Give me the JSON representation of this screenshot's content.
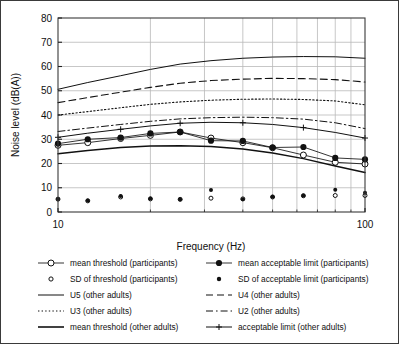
{
  "chart_data": {
    "type": "line",
    "title": "",
    "xlabel": "Frequency  (Hz)",
    "ylabel": "Noise level  (dB(A))",
    "xscale": "log",
    "xlim": [
      10,
      100
    ],
    "ylim": [
      0,
      80
    ],
    "ytick_labels": [
      "0",
      "10",
      "20",
      "30",
      "40",
      "50",
      "60",
      "70",
      "80"
    ],
    "yticks": [
      0,
      10,
      20,
      30,
      40,
      50,
      60,
      70,
      80
    ],
    "xtick_labels": [
      "10",
      "100"
    ],
    "xticks": [
      10,
      100
    ],
    "x_minor_gridlines": [
      20,
      30,
      40,
      50,
      60,
      70,
      80,
      90
    ],
    "grid": "both",
    "legend_position": "below-plot",
    "x": [
      10,
      12.5,
      16,
      20,
      25,
      31.5,
      40,
      50,
      63,
      80,
      100
    ],
    "series": [
      {
        "name": "mean threshold   (participants)",
        "key": "mean_threshold_participants",
        "style": "line-marker-open-circle",
        "values": [
          27.5,
          28.6,
          30.3,
          31.6,
          33.0,
          30.5,
          28.6,
          26.5,
          23.5,
          20.5,
          19.8
        ]
      },
      {
        "name": "mean acceptable limit (participants)",
        "key": "mean_limit_participants",
        "style": "line-marker-filled-circle",
        "values": [
          28.2,
          30.0,
          30.7,
          32.4,
          33.0,
          29.4,
          29.3,
          26.6,
          26.8,
          22.3,
          21.7
        ]
      },
      {
        "name": "SD of threshold   (participants)",
        "key": "sd_threshold_participants",
        "style": "marker-open-circle",
        "values": [
          5.3,
          4.6,
          6.2,
          5.4,
          5.2,
          5.7,
          5.4,
          6.2,
          6.7,
          6.8,
          6.8
        ]
      },
      {
        "name": "SD of acceptable limit (participants)",
        "key": "sd_limit_participants",
        "style": "marker-filled-circle",
        "values": [
          5.4,
          4.7,
          6.6,
          5.6,
          5.3,
          9.1,
          5.3,
          6.3,
          6.8,
          9.2,
          7.9
        ]
      },
      {
        "name": "U5 (other adults)",
        "key": "u5_other_adults",
        "style": "solid",
        "values": [
          50.6,
          53.4,
          56.2,
          58.8,
          61.0,
          62.4,
          63.4,
          63.9,
          64.1,
          64.0,
          63.4
        ]
      },
      {
        "name": "U4 (other adults)",
        "key": "u4_other_adults",
        "style": "dashed",
        "values": [
          45.1,
          47.2,
          49.4,
          51.4,
          53.1,
          54.2,
          54.8,
          55.1,
          55.0,
          54.6,
          53.6
        ]
      },
      {
        "name": "U3 (other adults)",
        "key": "u3_other_adults",
        "style": "dotted",
        "values": [
          40.0,
          41.4,
          43.0,
          44.4,
          45.4,
          46.1,
          46.5,
          46.6,
          46.4,
          45.8,
          44.2
        ]
      },
      {
        "name": "U2 (other adults)",
        "key": "u2_other_adults",
        "style": "dashdot",
        "values": [
          33.2,
          34.6,
          36.1,
          37.4,
          38.4,
          38.9,
          39.1,
          38.9,
          38.3,
          36.8,
          34.4
        ]
      },
      {
        "name": "mean threshold (other adults)",
        "key": "mean_threshold_other_adults",
        "style": "solid-thick",
        "values": [
          24.0,
          25.4,
          26.6,
          27.2,
          27.3,
          27.0,
          26.0,
          24.3,
          22.0,
          19.0,
          16.3
        ]
      },
      {
        "name": "acceptable limit  (other adults)",
        "key": "acceptable_limit_other_adults",
        "style": "solid-plus",
        "values": [
          30.8,
          32.5,
          34.1,
          35.5,
          36.6,
          37.0,
          36.8,
          36.1,
          34.8,
          32.8,
          30.5
        ]
      }
    ]
  },
  "legend": {
    "rows": [
      {
        "left": {
          "label": "mean threshold   (participants)",
          "style": "line-marker-open-circle"
        },
        "right": {
          "label": "mean acceptable limit (participants)",
          "style": "line-marker-filled-circle"
        }
      },
      {
        "left": {
          "label": "SD of threshold   (participants)",
          "style": "marker-open-circle"
        },
        "right": {
          "label": "SD of acceptable limit (participants)",
          "style": "marker-filled-circle"
        }
      },
      {
        "left": {
          "label": "U5 (other adults)",
          "style": "solid"
        },
        "right": {
          "label": "U4 (other adults)",
          "style": "dashed"
        }
      },
      {
        "left": {
          "label": "U3 (other adults)",
          "style": "dotted"
        },
        "right": {
          "label": "U2 (other adults)",
          "style": "dashdot"
        }
      },
      {
        "left": {
          "label": "mean threshold (other adults)",
          "style": "solid-thick"
        },
        "right": {
          "label": "acceptable limit  (other adults)",
          "style": "solid-plus"
        }
      }
    ]
  },
  "colors": {
    "line": "#111111",
    "grid": "#b9b9b9",
    "axis": "#202020",
    "frame": "#3a3a3a",
    "text": "#101010",
    "background": "#ffffff"
  }
}
